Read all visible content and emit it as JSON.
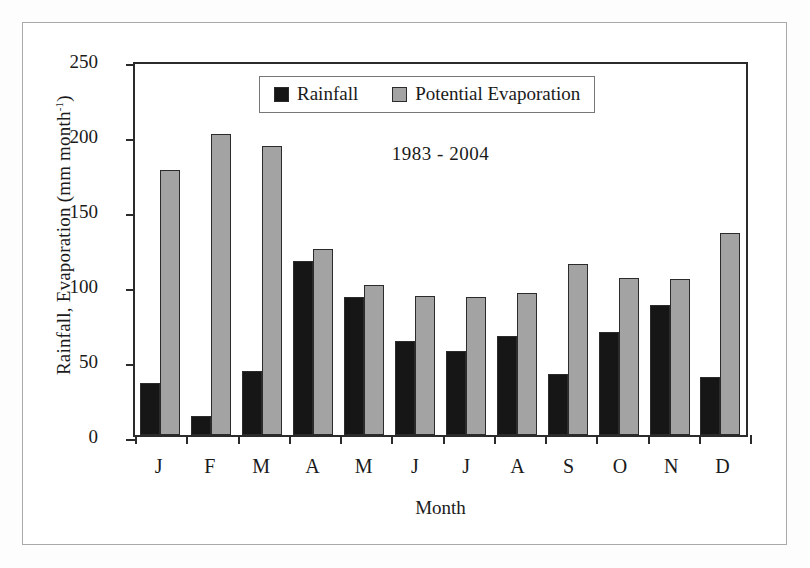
{
  "chart_data": {
    "type": "bar",
    "title": "1983 - 2004",
    "xlabel": "Month",
    "ylabel": "Rainfall, Evaporation (mm month",
    "ylabel_sup": "-1",
    "ylabel_tail": ")",
    "ylim": [
      0,
      250
    ],
    "yticks": [
      0,
      50,
      100,
      150,
      200,
      250
    ],
    "grid": false,
    "legend_position": "top-center",
    "categories": [
      "J",
      "F",
      "M",
      "A",
      "M",
      "J",
      "J",
      "A",
      "S",
      "O",
      "N",
      "D"
    ],
    "series": [
      {
        "name": "Rainfall",
        "color": "#161616",
        "values": [
          35,
          13,
          43,
          116,
          92,
          63,
          56,
          66,
          41,
          69,
          87,
          39
        ]
      },
      {
        "name": "Potential Evaporation",
        "color": "#a3a3a3",
        "values": [
          177,
          201,
          193,
          124,
          100,
          93,
          92,
          95,
          114,
          105,
          104,
          135
        ]
      }
    ]
  },
  "legend": {
    "items": [
      {
        "label": "Rainfall",
        "swatch": "black-square-icon"
      },
      {
        "label": "Potential Evaporation",
        "swatch": "gray-square-icon"
      }
    ]
  }
}
